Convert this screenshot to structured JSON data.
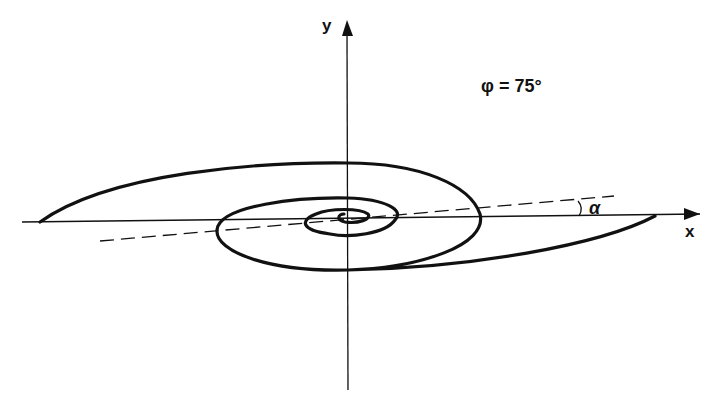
{
  "figure": {
    "type": "spiral-diagram",
    "axes": {
      "x_label": "x",
      "y_label": "y"
    },
    "annotation": {
      "phi_label": "φ = 75°",
      "alpha_label": "α"
    },
    "colors": {
      "stroke": "#111111",
      "background": "#ffffff"
    }
  }
}
